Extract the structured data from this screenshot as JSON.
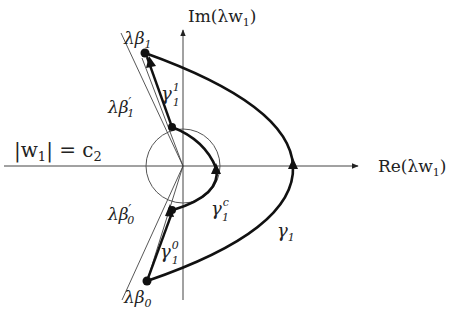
{
  "diagram": {
    "axes": {
      "x_label": "Re(λw",
      "x_label_sub": "1",
      "x_label_end": ")",
      "y_label": "Im(λw",
      "y_label_sub": "1",
      "y_label_end": ")"
    },
    "circle_label": {
      "lhs": "|w",
      "lhs_sub": "1",
      "rhs": "| = c",
      "rhs_sub": "2"
    },
    "points": {
      "beta1": {
        "main": "λβ",
        "sub": "1",
        "prime": ""
      },
      "beta1p": {
        "main": "λβ",
        "sub": "1",
        "prime": "′"
      },
      "beta0p": {
        "main": "λβ",
        "sub": "0",
        "prime": "′"
      },
      "beta0": {
        "main": "λβ",
        "sub": "0",
        "prime": ""
      }
    },
    "curves": {
      "gamma1": {
        "main": "γ",
        "sub": "1",
        "sup": ""
      },
      "gamma11": {
        "main": "γ",
        "sub": "1",
        "sup": "1"
      },
      "gamma10": {
        "main": "γ",
        "sub": "1",
        "sup": "0"
      },
      "gamma1c": {
        "main": "γ",
        "sub": "1",
        "sup": "c"
      }
    }
  }
}
